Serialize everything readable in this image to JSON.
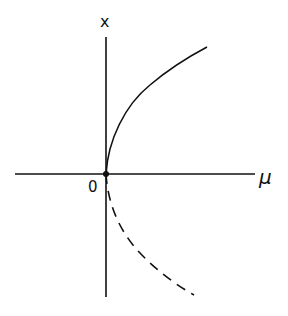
{
  "diagram": {
    "type": "bifurcation-diagram",
    "axes": {
      "horizontal_label": "μ",
      "vertical_label": "x",
      "origin_label": "0"
    },
    "branches": [
      {
        "name": "stable-branch",
        "style": "solid",
        "description": "x = +sqrt(mu), mu > 0"
      },
      {
        "name": "unstable-branch",
        "style": "dashed",
        "description": "x = -sqrt(mu), mu > 0"
      }
    ],
    "colors": {
      "ink": "#111111",
      "background": "#ffffff"
    }
  }
}
